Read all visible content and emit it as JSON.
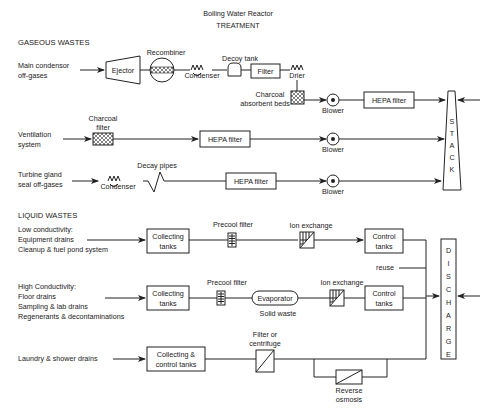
{
  "title": {
    "line1": "Boiling Water Reactor",
    "line2": "TREATMENT"
  },
  "gaseous": {
    "heading": "GASEOUS WASTES",
    "main_source": [
      "Main condensor",
      "off-gases"
    ],
    "ejector": "Ejector",
    "recombiner": "Recombiner",
    "condenser1": "Condenser",
    "decoy_tank": "Decoy tank",
    "filter": "Filter",
    "drier": "Drier",
    "charcoal_beds": [
      "Charcoal",
      "absorbent beds"
    ],
    "blower1": "Blower",
    "hepa1": "HEPA filter",
    "ventilation_source": [
      "Ventilation",
      "system"
    ],
    "charcoal_filter": [
      "Charcoal",
      "filter"
    ],
    "hepa2": "HEPA filter",
    "blower2": "Blower",
    "turbine_source": [
      "Turbine gland",
      "seal off-gases"
    ],
    "condenser2": "Condenser",
    "decay_pipes": "Decay pipes",
    "hepa3": "HEPA filter",
    "blower3": "Blower",
    "stack_letters": [
      "S",
      "T",
      "A",
      "C",
      "K"
    ]
  },
  "liquid": {
    "heading": "LIQUID WASTES",
    "low_source": [
      "Low conductivity:",
      "Equipment drains",
      "Cleanup & fuel pond system"
    ],
    "collecting1": [
      "Collecting",
      "tanks"
    ],
    "precool1": "Precool filter",
    "ion1": "Ion exchange",
    "control1": [
      "Control",
      "tanks"
    ],
    "reuse": "reuse",
    "high_source": [
      "High Conductivity:",
      "Floor drains",
      "Sampling & lab drains",
      "Regenerants & decontaminations"
    ],
    "collecting2": [
      "Collecting",
      "tanks"
    ],
    "precool2": "Precool filter",
    "evaporator": "Evaporator",
    "solid_waste": "Solid waste",
    "ion2": "Ion exchange",
    "control2": [
      "Control",
      "tanks"
    ],
    "laundry_source": "Laundry & shower drains",
    "collecting3": [
      "Collecting &",
      "control tanks"
    ],
    "filter_centrifuge": [
      "Filter or",
      "centrifuge"
    ],
    "reverse_osmosis": [
      "Reverse",
      "osmosis"
    ],
    "discharge_letters": [
      "D",
      "I",
      "S",
      "C",
      "H",
      "A",
      "R",
      "G",
      "E"
    ]
  }
}
